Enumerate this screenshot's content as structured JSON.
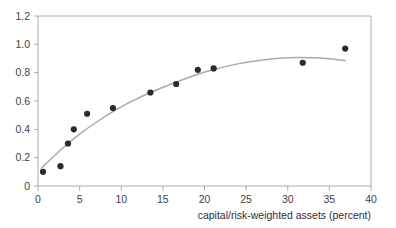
{
  "chart_data": {
    "type": "scatter",
    "title": "",
    "subtitle": "",
    "xlabel": "capital/risk-weighted assets (percent)",
    "ylabel": "",
    "xlim": [
      0,
      40
    ],
    "ylim": [
      0,
      1.2
    ],
    "xticks": [
      "0",
      "5",
      "10",
      "15",
      "20",
      "25",
      "30",
      "35",
      "40"
    ],
    "xtick_values": [
      0,
      5,
      10,
      15,
      20,
      25,
      30,
      35,
      40
    ],
    "yticks": [
      "0",
      "0.2",
      "0.4",
      "0.6",
      "0.8",
      "1.0",
      "1.2"
    ],
    "ytick_values": [
      0,
      0.2,
      0.4,
      0.6,
      0.8,
      1.0,
      1.2
    ],
    "grid": false,
    "legend": null,
    "legend_position": "none",
    "series": [
      {
        "name": "observations",
        "type": "scatter",
        "marker": "circle",
        "color": "#2b2b2f",
        "points": [
          {
            "x": 0.6,
            "y": 0.1
          },
          {
            "x": 2.7,
            "y": 0.14
          },
          {
            "x": 3.6,
            "y": 0.3
          },
          {
            "x": 4.3,
            "y": 0.4
          },
          {
            "x": 5.9,
            "y": 0.51
          },
          {
            "x": 9.0,
            "y": 0.55
          },
          {
            "x": 13.5,
            "y": 0.66
          },
          {
            "x": 16.6,
            "y": 0.72
          },
          {
            "x": 19.2,
            "y": 0.82
          },
          {
            "x": 21.1,
            "y": 0.83
          },
          {
            "x": 31.8,
            "y": 0.87
          },
          {
            "x": 36.9,
            "y": 0.97
          }
        ]
      },
      {
        "name": "fitted curve",
        "type": "line",
        "color": "#a9a9ad",
        "points": [
          {
            "x": 0.4,
            "y": 0.125
          },
          {
            "x": 2.0,
            "y": 0.215
          },
          {
            "x": 3.6,
            "y": 0.3
          },
          {
            "x": 5.2,
            "y": 0.375
          },
          {
            "x": 7.0,
            "y": 0.45
          },
          {
            "x": 9.0,
            "y": 0.525
          },
          {
            "x": 11.0,
            "y": 0.59
          },
          {
            "x": 13.5,
            "y": 0.66
          },
          {
            "x": 16.0,
            "y": 0.72
          },
          {
            "x": 18.5,
            "y": 0.775
          },
          {
            "x": 21.0,
            "y": 0.82
          },
          {
            "x": 24.0,
            "y": 0.862
          },
          {
            "x": 27.0,
            "y": 0.89
          },
          {
            "x": 30.0,
            "y": 0.905
          },
          {
            "x": 33.0,
            "y": 0.905
          },
          {
            "x": 35.0,
            "y": 0.898
          },
          {
            "x": 36.9,
            "y": 0.885
          }
        ]
      }
    ]
  },
  "axes": {
    "x_axis_label": "capital/risk-weighted assets (percent)"
  }
}
